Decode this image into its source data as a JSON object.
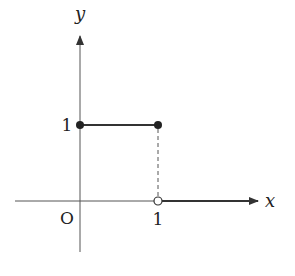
{
  "diagram": {
    "axes": {
      "x_label": "x",
      "y_label": "y",
      "origin_label": "O",
      "x_tick_label": "1",
      "y_tick_label": "1"
    },
    "segments": [
      {
        "from": [
          0,
          1
        ],
        "to": [
          1,
          1
        ],
        "style": "solid",
        "start": "closed",
        "end": "closed"
      },
      {
        "from": [
          1,
          0
        ],
        "to": [
          ">",
          0
        ],
        "style": "solid-arrow",
        "start": "open"
      }
    ],
    "guides": [
      {
        "from": [
          1,
          1
        ],
        "to": [
          1,
          0
        ],
        "style": "dashed"
      }
    ],
    "colors": {
      "stroke": "#333333",
      "background": "#ffffff"
    }
  }
}
